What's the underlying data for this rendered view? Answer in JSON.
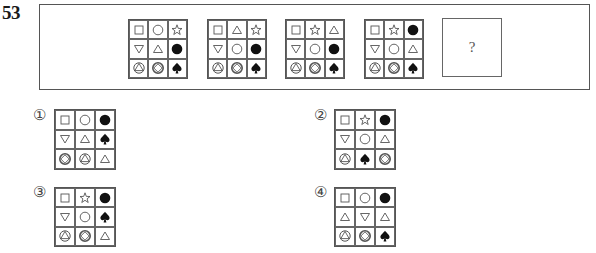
{
  "question": {
    "number": "53",
    "placeholder": "?"
  },
  "colors": {
    "line": "#555555",
    "fill": "#111111",
    "background": "#ffffff"
  },
  "icons": {
    "square": "□",
    "circle": "○",
    "star": "☆",
    "triangle_up": "△",
    "triangle_down": "▽",
    "filled_circle": "●",
    "spade": "♠",
    "circle_triangle": "circled-triangle",
    "circle_diamond": "circled-diamond"
  },
  "sequence": [
    {
      "id": "grid-1",
      "cells": [
        "square",
        "circle",
        "star",
        "triangle_down",
        "triangle_up",
        "filled_circle",
        "circle_triangle",
        "circle_diamond",
        "spade"
      ]
    },
    {
      "id": "grid-2",
      "cells": [
        "square",
        "triangle_up",
        "star",
        "triangle_down",
        "circle",
        "filled_circle",
        "circle_triangle",
        "circle_diamond",
        "spade"
      ]
    },
    {
      "id": "grid-3",
      "cells": [
        "square",
        "star",
        "triangle_up",
        "triangle_down",
        "circle",
        "filled_circle",
        "circle_triangle",
        "circle_diamond",
        "spade"
      ]
    },
    {
      "id": "grid-4",
      "cells": [
        "square",
        "star",
        "filled_circle",
        "triangle_down",
        "circle",
        "triangle_up",
        "circle_triangle",
        "circle_diamond",
        "spade"
      ]
    }
  ],
  "options": [
    {
      "label": "①",
      "cells": [
        "square",
        "circle",
        "filled_circle",
        "triangle_down",
        "triangle_up",
        "spade",
        "circle_diamond",
        "circle_triangle",
        "triangle_up"
      ]
    },
    {
      "label": "②",
      "cells": [
        "square",
        "star",
        "filled_circle",
        "triangle_down",
        "circle",
        "triangle_up",
        "circle_triangle",
        "spade",
        "circle_diamond"
      ]
    },
    {
      "label": "③",
      "cells": [
        "square",
        "star",
        "filled_circle",
        "triangle_down",
        "circle",
        "spade",
        "circle_triangle",
        "circle_diamond",
        "triangle_up"
      ]
    },
    {
      "label": "④",
      "cells": [
        "square",
        "circle",
        "filled_circle",
        "triangle_up",
        "triangle_down",
        "triangle_up",
        "circle_triangle",
        "circle_diamond",
        "spade"
      ]
    }
  ]
}
